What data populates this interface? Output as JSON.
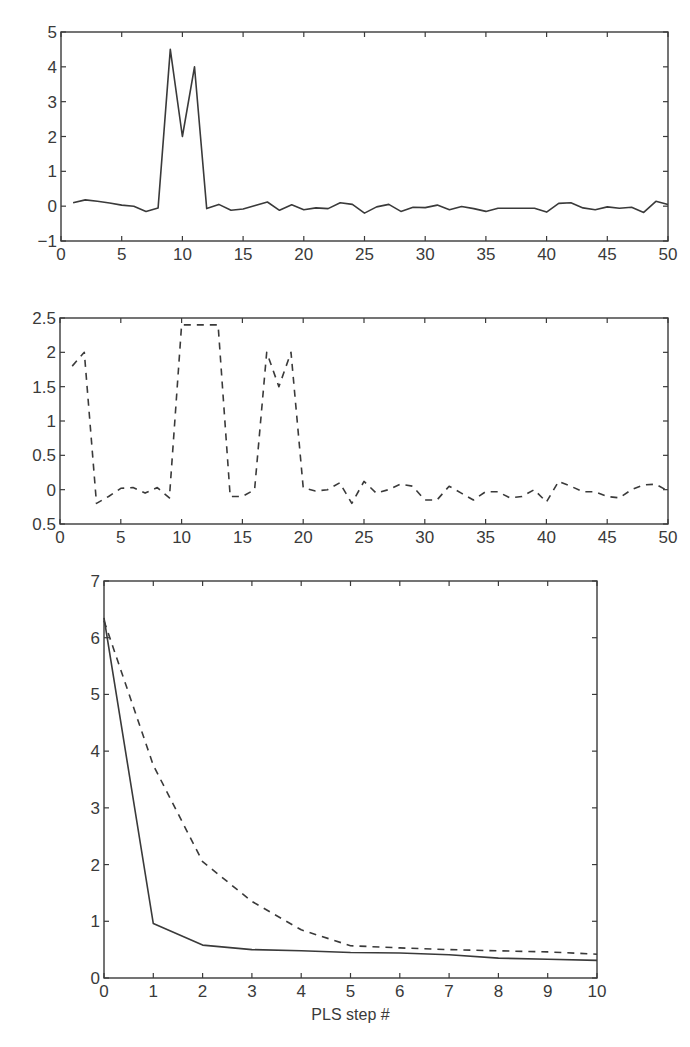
{
  "chart_data": [
    {
      "id": "top",
      "type": "line",
      "title": "",
      "xlabel": "",
      "ylabel": "",
      "xlim": [
        0,
        50
      ],
      "ylim": [
        -1,
        5
      ],
      "xticks": [
        0,
        5,
        10,
        15,
        20,
        25,
        30,
        35,
        40,
        45,
        50
      ],
      "yticks": [
        -1,
        0,
        1,
        2,
        3,
        4,
        5
      ],
      "ytick_labels": [
        "−1",
        "0",
        "1",
        "2",
        "3",
        "4",
        "5"
      ],
      "grid": false,
      "series": [
        {
          "name": "solid",
          "style": "solid",
          "x": [
            1,
            2,
            3,
            4,
            5,
            6,
            7,
            8,
            9,
            10,
            11,
            12,
            13,
            14,
            15,
            16,
            17,
            18,
            19,
            20,
            21,
            22,
            23,
            24,
            25,
            26,
            27,
            28,
            29,
            30,
            31,
            32,
            33,
            34,
            35,
            36,
            37,
            38,
            39,
            40,
            41,
            42,
            43,
            44,
            45,
            46,
            47,
            48,
            49,
            50
          ],
          "values": [
            0.1,
            0.18,
            0.14,
            0.09,
            0.03,
            0.0,
            -0.15,
            -0.05,
            4.5,
            2.0,
            4.0,
            -0.07,
            0.05,
            -0.12,
            -0.08,
            0.02,
            0.12,
            -0.12,
            0.04,
            -0.1,
            -0.05,
            -0.07,
            0.1,
            0.05,
            -0.2,
            -0.02,
            0.05,
            -0.15,
            -0.03,
            -0.04,
            0.03,
            -0.1,
            -0.01,
            -0.07,
            -0.15,
            -0.06,
            -0.06,
            -0.06,
            -0.06,
            -0.17,
            0.08,
            0.1,
            -0.05,
            -0.1,
            -0.02,
            -0.06,
            -0.03,
            -0.18,
            0.14,
            0.05
          ]
        }
      ]
    },
    {
      "id": "middle",
      "type": "line",
      "title": "",
      "xlabel": "",
      "ylabel": "",
      "xlim": [
        0,
        50
      ],
      "ylim": [
        -0.5,
        2.5
      ],
      "xticks": [
        0,
        5,
        10,
        15,
        20,
        25,
        30,
        35,
        40,
        45,
        50
      ],
      "yticks": [
        -0.5,
        0,
        0.5,
        1,
        1.5,
        2,
        2.5
      ],
      "ytick_labels": [
        "0.5",
        "0",
        "0.5",
        "1",
        "1.5",
        "2",
        "2.5"
      ],
      "grid": false,
      "series": [
        {
          "name": "dashed",
          "style": "dashed",
          "x": [
            1,
            2,
            3,
            4,
            5,
            6,
            7,
            8,
            9,
            10,
            11,
            12,
            13,
            14,
            15,
            16,
            17,
            18,
            19,
            20,
            21,
            22,
            23,
            24,
            25,
            26,
            27,
            28,
            29,
            30,
            31,
            32,
            33,
            34,
            35,
            36,
            37,
            38,
            39,
            40,
            41,
            42,
            43,
            44,
            45,
            46,
            47,
            48,
            49,
            50
          ],
          "values": [
            1.8,
            2.0,
            -0.2,
            -0.1,
            0.02,
            0.03,
            -0.05,
            0.03,
            -0.12,
            2.4,
            2.4,
            2.4,
            2.4,
            -0.1,
            -0.1,
            0.0,
            2.0,
            1.5,
            2.0,
            0.03,
            -0.02,
            0.0,
            0.1,
            -0.2,
            0.12,
            -0.05,
            0.0,
            0.08,
            0.05,
            -0.15,
            -0.15,
            0.05,
            -0.05,
            -0.15,
            -0.03,
            -0.03,
            -0.12,
            -0.1,
            0.0,
            -0.18,
            0.12,
            0.05,
            -0.03,
            -0.03,
            -0.1,
            -0.12,
            0.0,
            0.07,
            0.08,
            -0.02
          ]
        }
      ]
    },
    {
      "id": "bottom",
      "type": "line",
      "title": "",
      "xlabel": "PLS step #",
      "ylabel": "",
      "xlim": [
        0,
        10
      ],
      "ylim": [
        0,
        7
      ],
      "xticks": [
        0,
        1,
        2,
        3,
        4,
        5,
        6,
        7,
        8,
        9,
        10
      ],
      "yticks": [
        0,
        1,
        2,
        3,
        4,
        5,
        6,
        7
      ],
      "grid": false,
      "series": [
        {
          "name": "solid",
          "style": "solid",
          "x": [
            0,
            1,
            2,
            3,
            4,
            5,
            6,
            7,
            8,
            9,
            10
          ],
          "values": [
            6.35,
            0.96,
            0.58,
            0.5,
            0.48,
            0.45,
            0.44,
            0.41,
            0.35,
            0.33,
            0.31
          ]
        },
        {
          "name": "dashed",
          "style": "dashed",
          "x": [
            0,
            1,
            2,
            3,
            4,
            5,
            6,
            7,
            8,
            9,
            10
          ],
          "values": [
            6.3,
            3.75,
            2.05,
            1.35,
            0.85,
            0.57,
            0.53,
            0.5,
            0.48,
            0.46,
            0.42
          ]
        }
      ]
    }
  ]
}
